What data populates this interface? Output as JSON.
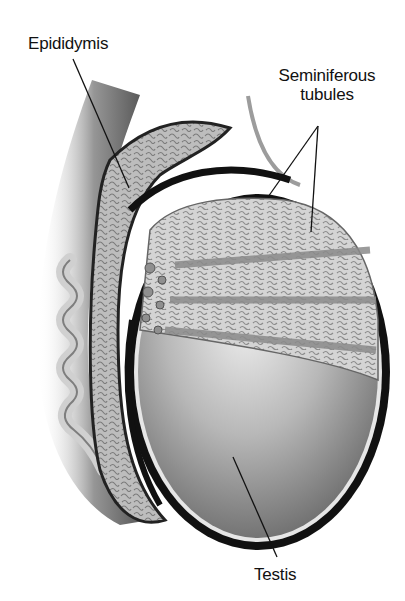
{
  "diagram": {
    "labels": [
      {
        "id": "epididymis",
        "text": "Epididymis",
        "x": 28,
        "y": 34
      },
      {
        "id": "seminiferous",
        "text_line1": "Seminiferous",
        "text_line2": "tubules",
        "x": 256,
        "y": 68
      },
      {
        "id": "testis",
        "text": "Testis",
        "x": 254,
        "y": 565
      }
    ],
    "colors": {
      "background": "#ffffff",
      "label_text": "#111111",
      "outline": "#111111",
      "tissue_light": "#d8d8d8",
      "tissue_mid": "#9a9a9a",
      "tissue_dark": "#555555",
      "testis_body": "#b5b5b5"
    }
  }
}
